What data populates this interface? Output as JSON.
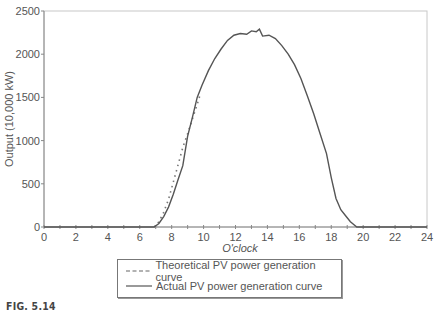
{
  "chart_data": {
    "type": "line",
    "title": "",
    "xlabel": "O'clock",
    "ylabel": "Output (10,000 kW)",
    "xlim": [
      0,
      24
    ],
    "ylim": [
      0,
      2500
    ],
    "x_ticks": [
      0,
      2,
      4,
      6,
      8,
      10,
      12,
      14,
      16,
      18,
      20,
      22,
      24
    ],
    "y_ticks": [
      0,
      500,
      1000,
      1500,
      2000,
      2500
    ],
    "grid": false,
    "legend_position": "bottom",
    "series": [
      {
        "name": "Theoretical PV power generation curve",
        "style": "dashed",
        "x": [
          6.9,
          7.2,
          7.5,
          7.8,
          8.1,
          8.4,
          8.7,
          9.0,
          9.3,
          9.6,
          9.8
        ],
        "y": [
          0,
          60,
          170,
          320,
          520,
          720,
          920,
          1080,
          1250,
          1420,
          1540
        ]
      },
      {
        "name": "Actual PV power generation curve",
        "style": "solid",
        "x": [
          0,
          6.9,
          7.2,
          7.5,
          7.8,
          8.1,
          8.4,
          8.7,
          9.0,
          9.3,
          9.6,
          9.9,
          10.3,
          10.7,
          11.1,
          11.5,
          11.9,
          12.3,
          12.7,
          13.0,
          13.3,
          13.5,
          13.7,
          14.1,
          14.5,
          14.9,
          15.3,
          15.7,
          16.1,
          16.5,
          16.9,
          17.3,
          17.7,
          18.0,
          18.3,
          18.6,
          18.9,
          19.2,
          19.6,
          20,
          24
        ],
        "y": [
          0,
          0,
          40,
          120,
          230,
          380,
          550,
          710,
          1050,
          1270,
          1500,
          1640,
          1810,
          1950,
          2060,
          2160,
          2220,
          2240,
          2230,
          2270,
          2260,
          2290,
          2210,
          2220,
          2180,
          2100,
          2000,
          1880,
          1720,
          1520,
          1310,
          1080,
          850,
          570,
          330,
          200,
          130,
          60,
          0,
          0,
          0
        ]
      }
    ]
  },
  "legend": {
    "items": [
      {
        "label": "Theoretical PV power generation curve"
      },
      {
        "label": "Actual PV power generation curve"
      }
    ]
  },
  "caption": "FIG. 5.14"
}
